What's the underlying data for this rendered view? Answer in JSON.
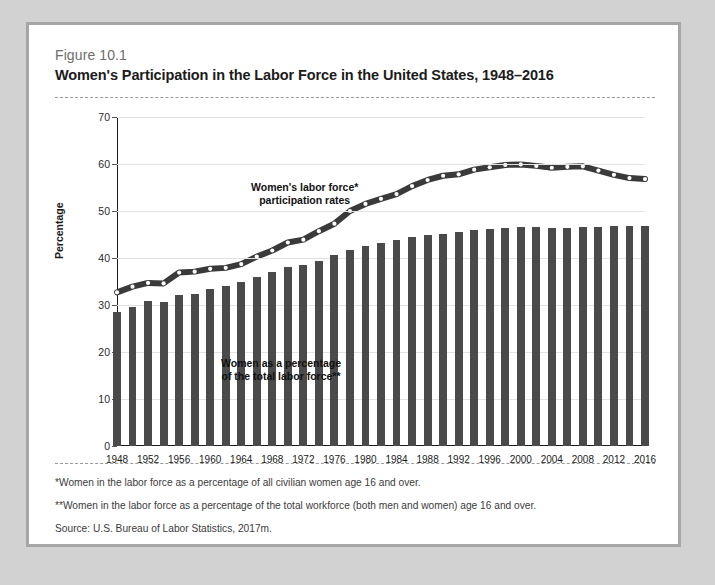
{
  "figure": {
    "number": "Figure 10.1",
    "title": "Women's Participation in the Labor Force in the United States, 1948–2016"
  },
  "notes": {
    "note1": "*Women in the labor force as a percentage of all civilian women age 16 and over.",
    "note2": "**Women in the labor force as a percentage of the total workforce (both men and women) age 16 and over.",
    "source": "Source: U.S. Bureau of Labor Statistics, 2017m."
  },
  "annotations": {
    "line_label_l1": "Women's labor force*",
    "line_label_l2": "participation rates",
    "bar_label_l1": "Women as a percentage",
    "bar_label_l2": "of the total labor force**"
  },
  "colors": {
    "bar": "#4a4a4a",
    "line": "#3a3a3a",
    "marker_fill": "#ffffff",
    "grid": "#e2e2e2",
    "axis": "#1b1b1b",
    "card_border": "#a6a6a6",
    "page_background": "#d2d2d2"
  },
  "chart_data": {
    "type": "bar",
    "title": "Women's Participation in the Labor Force in the United States, 1948–2016",
    "xlabel": "",
    "ylabel": "Percentage",
    "ylim": [
      0,
      70
    ],
    "yticks": [
      0,
      10,
      20,
      30,
      40,
      50,
      60,
      70
    ],
    "xlim": [
      1948,
      2016
    ],
    "xticks": [
      1948,
      1952,
      1956,
      1960,
      1964,
      1968,
      1972,
      1976,
      1980,
      1984,
      1988,
      1992,
      1996,
      2000,
      2004,
      2008,
      2012,
      2016
    ],
    "grid": true,
    "legend": "none",
    "x": [
      1948,
      1950,
      1952,
      1954,
      1956,
      1958,
      1960,
      1962,
      1964,
      1966,
      1968,
      1970,
      1972,
      1974,
      1976,
      1978,
      1980,
      1982,
      1984,
      1986,
      1988,
      1990,
      1992,
      1994,
      1996,
      1998,
      2000,
      2002,
      2004,
      2006,
      2008,
      2010,
      2012,
      2014,
      2016
    ],
    "series": [
      {
        "name": "Women as a percentage of the total labor force**",
        "type": "bar",
        "values": [
          28.6,
          29.6,
          30.8,
          30.6,
          32.2,
          32.3,
          33.4,
          34.0,
          34.8,
          36.0,
          37.1,
          38.1,
          38.5,
          39.4,
          40.6,
          41.7,
          42.5,
          43.3,
          43.8,
          44.5,
          45.0,
          45.2,
          45.5,
          46.0,
          46.2,
          46.3,
          46.6,
          46.5,
          46.4,
          46.3,
          46.5,
          46.7,
          46.9,
          46.8,
          46.8
        ]
      },
      {
        "name": "Women's labor force* participation rates",
        "type": "line",
        "values": [
          32.7,
          33.9,
          34.7,
          34.6,
          36.9,
          37.1,
          37.7,
          37.9,
          38.7,
          40.3,
          41.6,
          43.3,
          43.9,
          45.7,
          47.3,
          50.0,
          51.5,
          52.6,
          53.6,
          55.3,
          56.6,
          57.5,
          57.8,
          58.8,
          59.3,
          59.8,
          59.9,
          59.6,
          59.2,
          59.4,
          59.5,
          58.6,
          57.7,
          57.0,
          56.8
        ]
      }
    ]
  }
}
